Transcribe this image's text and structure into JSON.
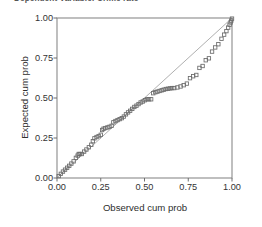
{
  "chart_data": {
    "type": "scatter",
    "title": "Dependent Variable: Crime rate",
    "subtitle": "",
    "xlabel": "Observed cum prob",
    "ylabel": "Expected cum prob",
    "xlim": [
      0.0,
      1.0
    ],
    "ylim": [
      0.0,
      1.0
    ],
    "xticks": [
      "0.00",
      "0.25",
      "0.50",
      "0.75",
      "1.00"
    ],
    "yticks": [
      "0.00",
      "0.25",
      "0.50",
      "0.75",
      "1.00"
    ],
    "xtick_values": [
      0.0,
      0.25,
      0.5,
      0.75,
      1.0
    ],
    "ytick_values": [
      0.0,
      0.25,
      0.5,
      0.75,
      1.0
    ],
    "grid": false,
    "legend": "none",
    "marker": "open-square",
    "marker_size": 3.4,
    "marker_color": "#6b6b6b",
    "reference_line": {
      "name": "diagonal reference line",
      "from": [
        0.0,
        0.0
      ],
      "to": [
        1.0,
        1.0
      ],
      "color": "#9a9a9a"
    },
    "series": [
      {
        "name": "Normal P-P of Regression Standardized Residual",
        "x": [
          0.01,
          0.022,
          0.034,
          0.046,
          0.058,
          0.07,
          0.082,
          0.095,
          0.108,
          0.118,
          0.124,
          0.13,
          0.142,
          0.155,
          0.168,
          0.182,
          0.196,
          0.205,
          0.214,
          0.226,
          0.238,
          0.25,
          0.258,
          0.266,
          0.276,
          0.288,
          0.3,
          0.312,
          0.322,
          0.334,
          0.346,
          0.358,
          0.37,
          0.382,
          0.394,
          0.406,
          0.418,
          0.43,
          0.442,
          0.454,
          0.466,
          0.478,
          0.49,
          0.502,
          0.514,
          0.526,
          0.538,
          0.55,
          0.562,
          0.574,
          0.586,
          0.598,
          0.61,
          0.622,
          0.634,
          0.646,
          0.658,
          0.67,
          0.688,
          0.706,
          0.724,
          0.742,
          0.76,
          0.778,
          0.796,
          0.814,
          0.832,
          0.85,
          0.868,
          0.886,
          0.904,
          0.922,
          0.94,
          0.955,
          0.968,
          0.978,
          0.986,
          0.992,
          0.996,
          1.0
        ],
        "y": [
          0.012,
          0.026,
          0.04,
          0.052,
          0.064,
          0.076,
          0.09,
          0.104,
          0.126,
          0.14,
          0.15,
          0.15,
          0.15,
          0.165,
          0.178,
          0.192,
          0.208,
          0.23,
          0.248,
          0.256,
          0.262,
          0.27,
          0.3,
          0.308,
          0.312,
          0.316,
          0.32,
          0.326,
          0.348,
          0.356,
          0.362,
          0.368,
          0.374,
          0.384,
          0.398,
          0.41,
          0.42,
          0.432,
          0.444,
          0.452,
          0.462,
          0.472,
          0.478,
          0.486,
          0.492,
          0.492,
          0.492,
          0.53,
          0.536,
          0.54,
          0.544,
          0.548,
          0.552,
          0.556,
          0.558,
          0.56,
          0.562,
          0.562,
          0.566,
          0.572,
          0.58,
          0.59,
          0.624,
          0.636,
          0.644,
          0.688,
          0.7,
          0.736,
          0.748,
          0.79,
          0.816,
          0.836,
          0.87,
          0.896,
          0.918,
          0.94,
          0.958,
          0.972,
          0.984,
          0.996
        ]
      }
    ]
  },
  "plot_geometry": {
    "left": 57,
    "top": 18,
    "right": 232,
    "bottom": 178
  }
}
